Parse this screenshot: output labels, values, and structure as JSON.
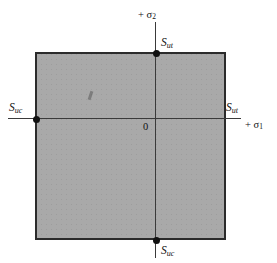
{
  "figure": {
    "name": "maximum-normal-stress-failure-envelope",
    "background_color": "#ffffff",
    "envelope_fill_color": "#a9a9a9",
    "envelope_border_color": "#2b2b2b",
    "axis_color": "#3a3a3a",
    "point_color": "#111111"
  },
  "axes": {
    "vertical": {
      "label_prefix": "+ ",
      "label_symbol": "σ",
      "label_subscript": "2",
      "label_full": "+ σ2"
    },
    "horizontal": {
      "label_prefix": "+ ",
      "label_symbol": "σ",
      "label_subscript": "1",
      "label_full": "+ σ1"
    },
    "origin_label": "0"
  },
  "labels": {
    "top": {
      "symbol": "S",
      "subscript": "ut",
      "full": "Sut"
    },
    "right": {
      "symbol": "S",
      "subscript": "ut",
      "full": "Sut"
    },
    "left": {
      "symbol": "S",
      "subscript": "uc",
      "full": "Suc"
    },
    "bottom": {
      "symbol": "S",
      "subscript": "uc",
      "full": "Suc"
    }
  },
  "chart_data": {
    "type": "line",
    "title": "",
    "xlabel": "+ σ1",
    "ylabel": "+ σ2",
    "grid": false,
    "legend": "none",
    "xlim": [
      -1.63,
      1.0
    ],
    "ylim": [
      -1.64,
      1.0
    ],
    "envelope": {
      "shape": "rectangle",
      "x_min": -1.63,
      "x_max": 1.0,
      "y_min": -1.64,
      "y_max": 1.0,
      "x_min_label": "Suc",
      "x_max_label": "Sut",
      "y_min_label": "Suc",
      "y_max_label": "Sut",
      "corners": [
        [
          -1.63,
          1.0
        ],
        [
          1.0,
          1.0
        ],
        [
          1.0,
          -1.64
        ],
        [
          -1.63,
          -1.64
        ]
      ],
      "fill": "#a9a9a9"
    },
    "markers": [
      {
        "x": 0.0,
        "y": 1.0,
        "label": "Sut",
        "position": "top"
      },
      {
        "x": -1.63,
        "y": 0.0,
        "label": "Suc",
        "position": "left"
      },
      {
        "x": 0.0,
        "y": -1.64,
        "label": "Suc",
        "position": "bottom"
      }
    ],
    "annotations": [
      {
        "text": "Sut",
        "position": "right-axis-intercept"
      },
      {
        "text": "0",
        "position": "origin"
      }
    ]
  }
}
